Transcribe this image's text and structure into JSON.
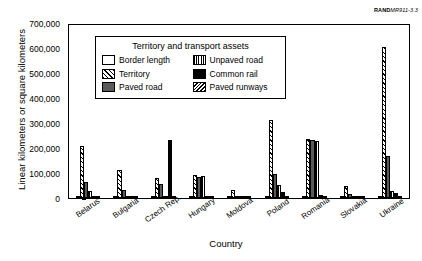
{
  "source_note": {
    "brand": "RAND",
    "doc_id": "MR911-3.3"
  },
  "chart_data": {
    "type": "bar",
    "title": "",
    "xlabel": "Country",
    "ylabel": "Linear kilometers or square kilometers",
    "ylim": [
      0,
      700000
    ],
    "yticks": [
      0,
      100000,
      200000,
      300000,
      400000,
      500000,
      600000,
      700000
    ],
    "ytick_labels": [
      "0",
      "100,000",
      "200,000",
      "300,000",
      "400,000",
      "500,000",
      "600,000",
      "700,000"
    ],
    "grid": false,
    "legend_position": "inside-upper-left",
    "legend_title": "Territory and transport assets",
    "categories": [
      "Belarus",
      "Bulgaria",
      "Czech Rep.",
      "Hungary",
      "Moldova",
      "Poland",
      "Romania",
      "Slovakia",
      "Ukraine"
    ],
    "series": [
      {
        "name": "Border length",
        "pattern": "white-fill",
        "values": [
          3000,
          2000,
          1900,
          2200,
          1400,
          3100,
          2500,
          1400,
          4600
        ]
      },
      {
        "name": "Territory",
        "pattern": "diagonal-hatch-forward",
        "values": [
          208000,
          111000,
          79000,
          93000,
          34000,
          313000,
          238000,
          49000,
          604000
        ]
      },
      {
        "name": "Paved road",
        "pattern": "solid-dark-gray",
        "values": [
          66000,
          33000,
          55000,
          85000,
          10000,
          96000,
          231000,
          17000,
          169000
        ]
      },
      {
        "name": "Unpaved road",
        "pattern": "vertical-lines",
        "values": [
          29000,
          4000,
          1000,
          90000,
          2000,
          53000,
          230000,
          4000,
          29000
        ]
      },
      {
        "name": "Common rail",
        "pattern": "solid-black",
        "values": [
          5500,
          4300,
          231000,
          7800,
          1300,
          23000,
          11000,
          3700,
          22000
        ]
      },
      {
        "name": "Paved runways",
        "pattern": "diagonal-hatch-back",
        "values": [
          1200,
          800,
          900,
          700,
          400,
          1300,
          1000,
          500,
          1500
        ]
      }
    ]
  }
}
